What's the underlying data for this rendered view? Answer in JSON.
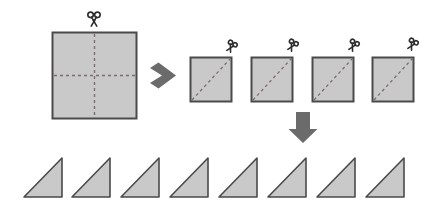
{
  "figure": {
    "title": "Paper folding and cutting instruction diagram",
    "background_color": "#ffffff",
    "paper_fill_color": "#c9c9c9",
    "paper_outline_color": "#4a4a4a",
    "fold_line_color": "#7d6d6d",
    "arrow_color": "#6b6b6b",
    "scissors_color": "#2b2b2b"
  },
  "steps": [
    {
      "id": "step-1",
      "label": "Large square with dashed vertical and horizontal fold lines and scissors above",
      "shape": "square",
      "count": 1,
      "fold_lines": "cross",
      "scissors": 1
    },
    {
      "id": "step-2",
      "label": "Four small squares each with a dashed diagonal fold line and scissors above",
      "shape": "square",
      "count": 4,
      "fold_lines": "diagonal",
      "scissors": 4
    },
    {
      "id": "step-3",
      "label": "Eight right triangles in a row",
      "shape": "right-triangle",
      "count": 8,
      "fold_lines": "none",
      "scissors": 0
    }
  ],
  "arrows": [
    {
      "id": "arrow-right",
      "direction": "right",
      "from": "step-1",
      "to": "step-2"
    },
    {
      "id": "arrow-down",
      "direction": "down",
      "from": "step-2",
      "to": "step-3"
    }
  ],
  "big_square": {
    "x": 52,
    "y": 32,
    "width": 84,
    "height": 86
  },
  "small_squares": [
    {
      "index": 1,
      "x": 190,
      "y": 57,
      "width": 41,
      "height": 44
    },
    {
      "index": 2,
      "x": 251,
      "y": 57,
      "width": 41,
      "height": 44
    },
    {
      "index": 3,
      "x": 312,
      "y": 57,
      "width": 41,
      "height": 44
    },
    {
      "index": 4,
      "x": 372,
      "y": 57,
      "width": 41,
      "height": 44
    }
  ],
  "triangles": [
    {
      "index": 1,
      "x": 24,
      "y": 158,
      "width": 38,
      "height": 39
    },
    {
      "index": 2,
      "x": 72,
      "y": 158,
      "width": 38,
      "height": 39
    },
    {
      "index": 3,
      "x": 121,
      "y": 158,
      "width": 38,
      "height": 39
    },
    {
      "index": 4,
      "x": 170,
      "y": 158,
      "width": 38,
      "height": 39
    },
    {
      "index": 5,
      "x": 219,
      "y": 158,
      "width": 38,
      "height": 39
    },
    {
      "index": 6,
      "x": 268,
      "y": 158,
      "width": 38,
      "height": 39
    },
    {
      "index": 7,
      "x": 317,
      "y": 158,
      "width": 38,
      "height": 39
    },
    {
      "index": 8,
      "x": 366,
      "y": 158,
      "width": 38,
      "height": 39
    }
  ],
  "icons": {
    "scissors": "scissors-icon",
    "arrow_right": "arrow-right-icon",
    "arrow_down": "arrow-down-icon"
  }
}
